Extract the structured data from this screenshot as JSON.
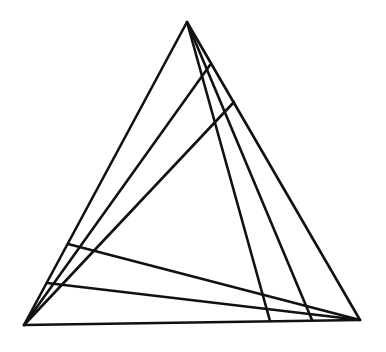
{
  "diagram": {
    "type": "geometric-figure",
    "stroke_color": "#111111",
    "background": "#ffffff",
    "vertices": {
      "A": [
        187,
        22
      ],
      "B": [
        24,
        325
      ],
      "C": [
        360,
        320
      ]
    },
    "cevians": [
      {
        "from": "A",
        "to": [
          270,
          321
        ]
      },
      {
        "from": "A",
        "to": [
          312,
          320
        ]
      },
      {
        "from": "B",
        "to": [
          210,
          65
        ]
      },
      {
        "from": "B",
        "to": [
          234,
          102
        ]
      },
      {
        "from": "C",
        "to": [
          68,
          244
        ]
      },
      {
        "from": "C",
        "to": [
          47,
          283
        ]
      }
    ]
  }
}
